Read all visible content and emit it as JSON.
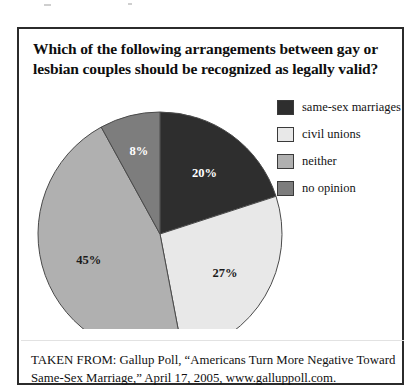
{
  "figure": {
    "title": "Which of the following arrangements between gay or lesbian couples should be recognized as legally valid?",
    "title_line1": "Which of the following arrangements between gay or",
    "title_line2": "lesbian couples should be recognized as legally valid?",
    "caption_line1": "TAKEN FROM: Gallup Poll, “Americans Turn More Negative Toward",
    "caption_line2": "Same-Sex Marriage,” April 17, 2005, www.galluppoll.com."
  },
  "legend": {
    "items": [
      {
        "label": "same-sex marriages",
        "color": "#2e2e2e",
        "swatch_name": "legend-swatch-same-sex-marriages"
      },
      {
        "label": "civil unions",
        "color": "#e8e8e8",
        "swatch_name": "legend-swatch-civil-unions"
      },
      {
        "label": "neither",
        "color": "#b0b0b0",
        "swatch_name": "legend-swatch-neither"
      },
      {
        "label": "no opinion",
        "color": "#7d7d7d",
        "swatch_name": "legend-swatch-no-opinion"
      }
    ]
  },
  "chart_data": {
    "type": "pie",
    "title": "Which of the following arrangements between gay or lesbian couples should be recognized as legally valid?",
    "xlabel": "",
    "ylabel": "",
    "legend_position": "right",
    "grid": false,
    "units": "percent",
    "start_angle_deg": 0,
    "direction": "clockwise",
    "categories": [
      "same-sex marriages",
      "civil unions",
      "neither",
      "no opinion"
    ],
    "values": [
      20,
      27,
      45,
      8
    ],
    "labels": [
      "20%",
      "27%",
      "45%",
      "8%"
    ],
    "colors": [
      "#2e2e2e",
      "#e8e8e8",
      "#b0b0b0",
      "#7d7d7d"
    ],
    "slices": [
      {
        "name": "same-sex marriages",
        "value": 20,
        "label": "20%",
        "color": "#2e2e2e",
        "label_fill": "light"
      },
      {
        "name": "civil unions",
        "value": 27,
        "label": "27%",
        "color": "#e8e8e8",
        "label_fill": "dark"
      },
      {
        "name": "neither",
        "value": 45,
        "label": "45%",
        "color": "#b0b0b0",
        "label_fill": "dark"
      },
      {
        "name": "no opinion",
        "value": 8,
        "label": "8%",
        "color": "#7d7d7d",
        "label_fill": "light"
      }
    ],
    "source": "Gallup Poll, “Americans Turn More Negative Toward Same-Sex Marriage,” April 17, 2005, www.galluppoll.com."
  }
}
